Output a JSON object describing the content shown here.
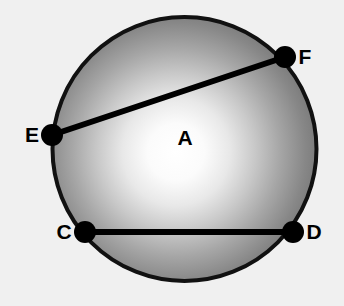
{
  "canvas": {
    "width": 344,
    "height": 306,
    "background_color": "#f0f0f0"
  },
  "chart_data": {
    "type": "diagram",
    "subtype": "euclidean-circle-with-chords",
    "title": "",
    "circle": {
      "label": "A",
      "center_x": 184.5,
      "center_y": 149,
      "radius": 132,
      "stroke_color": "#111111",
      "stroke_width": 4,
      "fill_style": "radial-gradient",
      "fill_highlight_color": "#ffffff",
      "fill_edge_color": "#6e6e6e",
      "highlight_x": 176,
      "highlight_y": 152
    },
    "points": [
      {
        "label": "A",
        "kind": "center-label",
        "x": 185,
        "y": 145,
        "dot": false,
        "label_dx": 0,
        "label_dy": 0,
        "label_anchor": "middle"
      },
      {
        "label": "E",
        "kind": "chord-endpoint",
        "x": 52,
        "y": 135,
        "dot": true,
        "label_dx": -20,
        "label_dy": 7,
        "label_anchor": "middle"
      },
      {
        "label": "F",
        "kind": "chord-endpoint",
        "x": 285,
        "y": 57,
        "dot": true,
        "label_dx": 20,
        "label_dy": 7,
        "label_anchor": "middle"
      },
      {
        "label": "C",
        "kind": "chord-endpoint",
        "x": 85,
        "y": 232,
        "dot": true,
        "label_dx": -21,
        "label_dy": 7,
        "label_anchor": "middle"
      },
      {
        "label": "D",
        "kind": "chord-endpoint",
        "x": 293,
        "y": 232,
        "dot": true,
        "label_dx": 21,
        "label_dy": 7,
        "label_anchor": "middle"
      }
    ],
    "dot_radius": 11,
    "dot_color": "#000000",
    "chords": [
      {
        "name": "chord-EF",
        "from": "E",
        "to": "F",
        "x1": 52,
        "y1": 135,
        "x2": 285,
        "y2": 57,
        "stroke_color": "#000000",
        "stroke_width": 6
      },
      {
        "name": "chord-CD",
        "from": "C",
        "to": "D",
        "x1": 85,
        "y1": 232,
        "x2": 293,
        "y2": 232,
        "stroke_color": "#000000",
        "stroke_width": 6
      }
    ],
    "labels": [
      "A",
      "C",
      "D",
      "E",
      "F"
    ],
    "grid": false,
    "legend": false,
    "axis_labels": {
      "x": "",
      "y": ""
    }
  }
}
